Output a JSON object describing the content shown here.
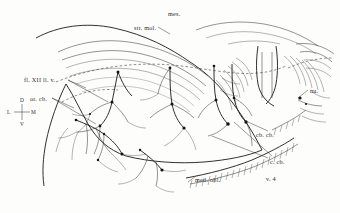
{
  "figure": {
    "kind": "anatomical-line-drawing",
    "technique": "pen-and-ink stipple and line drawing",
    "width": 340,
    "height": 213,
    "background_color": "#fdfdfc",
    "ink_color": "#1d1d1d"
  },
  "labels": [
    {
      "id": "str-mol",
      "text": "str. mol.",
      "meaning": "stratum moleculare",
      "x": 134,
      "y": 25,
      "leader": true
    },
    {
      "id": "mes",
      "text": "mes.",
      "meaning": "mesencephalon",
      "x": 168,
      "y": 11,
      "leader": false
    },
    {
      "id": "fl-xii-llv",
      "text": "fl. XII ll. v.",
      "meaning": "fasciculus of the twelfth nerve, lateral ventral",
      "x": 24,
      "y": 77,
      "leader": true
    },
    {
      "id": "orcb",
      "text": "or. cb.",
      "meaning": "organum cerebelli",
      "x": 30,
      "y": 96,
      "leader": true
    },
    {
      "id": "nu",
      "text": "nu.",
      "meaning": "nucleus",
      "x": 310,
      "y": 88,
      "leader": true
    },
    {
      "id": "cb-cb",
      "text": "cb. cb.",
      "meaning": "corpus cerebelli",
      "x": 256,
      "y": 132,
      "leader": true
    },
    {
      "id": "c-cb",
      "text": "c. cb.",
      "meaning": "cortex cerebelli",
      "x": 270,
      "y": 159,
      "leader": true
    },
    {
      "id": "v-4",
      "text": "v. 4",
      "meaning": "fourth ventricle",
      "x": 266,
      "y": 176,
      "leader": false
    },
    {
      "id": "med-obl",
      "text": "med. obl.",
      "meaning": "medulla oblongata",
      "x": 195,
      "y": 177,
      "leader": true
    }
  ],
  "orientation_key": {
    "name": "orientation-compass",
    "center_x": 22,
    "center_y": 112,
    "dorsal": "D",
    "ventral": "V",
    "lateral": "L",
    "medial": "M"
  }
}
